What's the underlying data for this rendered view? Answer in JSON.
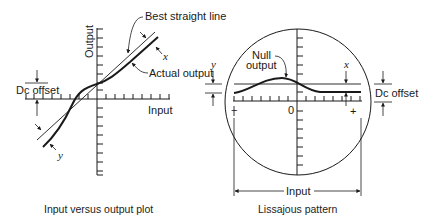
{
  "left_plot": {
    "caption": "Input versus output plot",
    "y_axis_label": "Output",
    "x_axis_label": "Input",
    "labels": {
      "best_straight_line": "Best straight line",
      "actual_output": "Actual output",
      "dc_offset": "Dc offset",
      "x": "x",
      "y": "y"
    }
  },
  "right_plot": {
    "caption": "Lissajous pattern",
    "labels": {
      "null_output": "Null output",
      "null_line1": "Null",
      "null_line2": "output",
      "dc_offset": "Dc offset",
      "x": "x",
      "y": "y",
      "origin": "0",
      "minus": "−",
      "plus": "+",
      "input": "Input"
    }
  },
  "colors": {
    "ink": "#1a1a1a",
    "background": "#ffffff"
  }
}
